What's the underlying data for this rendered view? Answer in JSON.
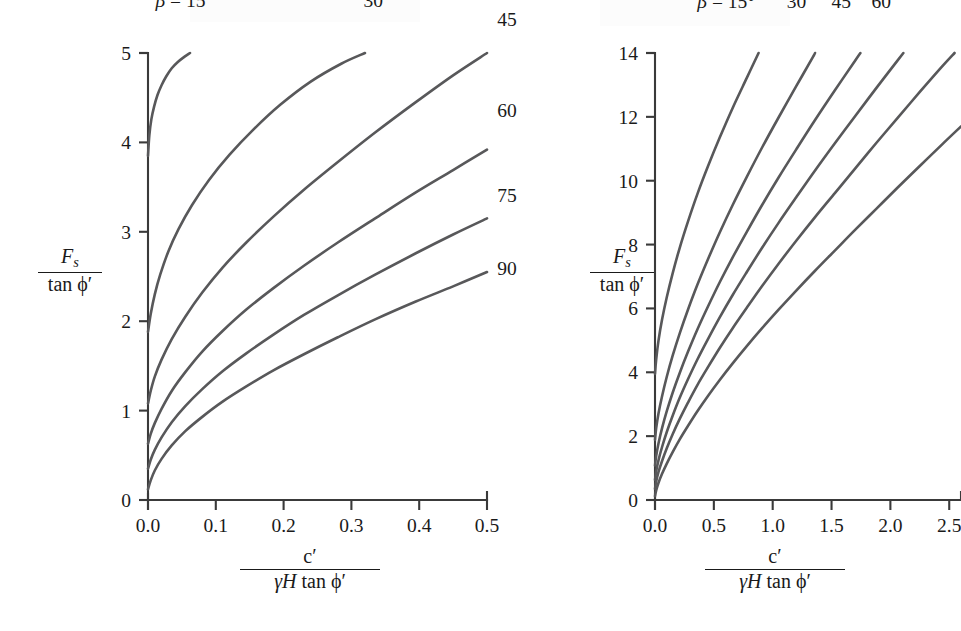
{
  "figure": {
    "background_color": "#ffffff",
    "curve_color": "#58585a",
    "axis_color": "#3a3a3a",
    "text_color": "#1a1a1a"
  },
  "axis_label_parts": {
    "y_numerator": "F",
    "y_numerator_sub": "s",
    "y_denominator": "tan ϕ′",
    "x_numerator": "c′",
    "x_denominator_gamma": "γ",
    "x_denominator_H": "H",
    "x_denominator_rest": "tan ϕ′"
  },
  "chart_data": [
    {
      "id": "left-chart",
      "type": "line",
      "title": "",
      "xlabel": "c′ / (γH tan ϕ′)",
      "ylabel": "F_s / tan ϕ′",
      "xlim": [
        0.0,
        0.5
      ],
      "ylim": [
        0,
        5
      ],
      "xticks": [
        "0.0",
        "0.1",
        "0.2",
        "0.3",
        "0.4",
        "0.5"
      ],
      "xtick_values": [
        0.0,
        0.1,
        0.2,
        0.3,
        0.4,
        0.5
      ],
      "yticks": [
        "0",
        "1",
        "2",
        "3",
        "4",
        "5"
      ],
      "ytick_values": [
        0,
        1,
        2,
        3,
        4,
        5
      ],
      "grid": false,
      "legend": "inline-curve-labels",
      "beta_prefix": "β = 15°",
      "series": [
        {
          "name": "15",
          "label": "β = 15°",
          "label_x": 0.011,
          "label_y": 5.52,
          "points": [
            [
              0.0,
              3.85
            ],
            [
              0.002,
              4.08
            ],
            [
              0.005,
              4.26
            ],
            [
              0.009,
              4.4
            ],
            [
              0.014,
              4.53
            ],
            [
              0.02,
              4.64
            ],
            [
              0.027,
              4.74
            ],
            [
              0.035,
              4.83
            ],
            [
              0.044,
              4.9
            ],
            [
              0.054,
              4.96
            ],
            [
              0.062,
              5.0
            ]
          ]
        },
        {
          "name": "30",
          "label": "30",
          "label_x": 0.318,
          "label_y": 5.52,
          "points": [
            [
              0.0,
              1.88
            ],
            [
              0.004,
              2.08
            ],
            [
              0.01,
              2.3
            ],
            [
              0.018,
              2.52
            ],
            [
              0.03,
              2.78
            ],
            [
              0.045,
              3.03
            ],
            [
              0.065,
              3.3
            ],
            [
              0.09,
              3.58
            ],
            [
              0.12,
              3.86
            ],
            [
              0.155,
              4.14
            ],
            [
              0.195,
              4.42
            ],
            [
              0.24,
              4.68
            ],
            [
              0.285,
              4.88
            ],
            [
              0.32,
              5.0
            ]
          ]
        },
        {
          "name": "45",
          "label": "45",
          "label_x": 0.515,
          "label_y": 5.3,
          "points": [
            [
              0.0,
              1.08
            ],
            [
              0.004,
              1.22
            ],
            [
              0.01,
              1.38
            ],
            [
              0.02,
              1.57
            ],
            [
              0.035,
              1.8
            ],
            [
              0.055,
              2.05
            ],
            [
              0.08,
              2.32
            ],
            [
              0.11,
              2.6
            ],
            [
              0.145,
              2.88
            ],
            [
              0.185,
              3.17
            ],
            [
              0.23,
              3.47
            ],
            [
              0.28,
              3.78
            ],
            [
              0.335,
              4.11
            ],
            [
              0.395,
              4.45
            ],
            [
              0.45,
              4.75
            ],
            [
              0.5,
              5.0
            ]
          ]
        },
        {
          "name": "60",
          "label": "60",
          "label_x": 0.515,
          "label_y": 4.28,
          "points": [
            [
              0.0,
              0.63
            ],
            [
              0.004,
              0.74
            ],
            [
              0.01,
              0.86
            ],
            [
              0.02,
              1.02
            ],
            [
              0.035,
              1.22
            ],
            [
              0.055,
              1.43
            ],
            [
              0.08,
              1.66
            ],
            [
              0.11,
              1.89
            ],
            [
              0.145,
              2.13
            ],
            [
              0.185,
              2.37
            ],
            [
              0.23,
              2.62
            ],
            [
              0.28,
              2.88
            ],
            [
              0.335,
              3.15
            ],
            [
              0.395,
              3.44
            ],
            [
              0.45,
              3.69
            ],
            [
              0.5,
              3.92
            ]
          ]
        },
        {
          "name": "75",
          "label": "75",
          "label_x": 0.515,
          "label_y": 3.33,
          "points": [
            [
              0.0,
              0.35
            ],
            [
              0.004,
              0.45
            ],
            [
              0.01,
              0.56
            ],
            [
              0.02,
              0.7
            ],
            [
              0.035,
              0.87
            ],
            [
              0.055,
              1.05
            ],
            [
              0.08,
              1.24
            ],
            [
              0.11,
              1.44
            ],
            [
              0.145,
              1.64
            ],
            [
              0.185,
              1.85
            ],
            [
              0.23,
              2.07
            ],
            [
              0.28,
              2.29
            ],
            [
              0.335,
              2.52
            ],
            [
              0.395,
              2.76
            ],
            [
              0.45,
              2.97
            ],
            [
              0.5,
              3.15
            ]
          ]
        },
        {
          "name": "90",
          "label": "90",
          "label_x": 0.515,
          "label_y": 2.52,
          "points": [
            [
              0.0,
              0.12
            ],
            [
              0.004,
              0.22
            ],
            [
              0.01,
              0.33
            ],
            [
              0.02,
              0.46
            ],
            [
              0.035,
              0.61
            ],
            [
              0.055,
              0.77
            ],
            [
              0.08,
              0.93
            ],
            [
              0.11,
              1.1
            ],
            [
              0.145,
              1.27
            ],
            [
              0.185,
              1.45
            ],
            [
              0.23,
              1.63
            ],
            [
              0.28,
              1.82
            ],
            [
              0.335,
              2.02
            ],
            [
              0.395,
              2.22
            ],
            [
              0.45,
              2.39
            ],
            [
              0.5,
              2.55
            ]
          ]
        }
      ]
    },
    {
      "id": "right-chart",
      "type": "line",
      "title": "",
      "xlabel": "c′ / (γH tan ϕ′)",
      "ylabel": "F_s / tan ϕ′",
      "xlim": [
        0.0,
        2.6
      ],
      "ylim": [
        0,
        14
      ],
      "xticks": [
        "0.0",
        "0.5",
        "1.0",
        "1.5",
        "2.0",
        "2.5"
      ],
      "xtick_values": [
        0.0,
        0.5,
        1.0,
        1.5,
        2.0,
        2.5
      ],
      "yticks": [
        "0",
        "2",
        "4",
        "6",
        "8",
        "10",
        "12",
        "14"
      ],
      "ytick_values": [
        0,
        2,
        4,
        6,
        8,
        10,
        12,
        14
      ],
      "grid": false,
      "legend": "inline-curve-labels",
      "beta_prefix": "β = 15°",
      "header_labels": [
        "β = 15°",
        "30",
        "45",
        "60"
      ],
      "series": [
        {
          "name": "15",
          "label": "β = 15°",
          "label_x": 0.36,
          "label_y": 15.4,
          "points": [
            [
              0.0,
              3.95
            ],
            [
              0.01,
              4.4
            ],
            [
              0.03,
              5.0
            ],
            [
              0.06,
              5.65
            ],
            [
              0.1,
              6.35
            ],
            [
              0.15,
              7.1
            ],
            [
              0.21,
              7.9
            ],
            [
              0.28,
              8.72
            ],
            [
              0.36,
              9.58
            ],
            [
              0.45,
              10.45
            ],
            [
              0.55,
              11.35
            ],
            [
              0.66,
              12.28
            ],
            [
              0.78,
              13.22
            ],
            [
              0.88,
              14.0
            ]
          ]
        },
        {
          "name": "30",
          "label": "30",
          "label_x": 1.12,
          "label_y": 15.4,
          "points": [
            [
              0.0,
              1.88
            ],
            [
              0.01,
              2.25
            ],
            [
              0.03,
              2.72
            ],
            [
              0.06,
              3.25
            ],
            [
              0.1,
              3.86
            ],
            [
              0.15,
              4.52
            ],
            [
              0.21,
              5.22
            ],
            [
              0.28,
              5.96
            ],
            [
              0.36,
              6.74
            ],
            [
              0.45,
              7.54
            ],
            [
              0.55,
              8.38
            ],
            [
              0.66,
              9.24
            ],
            [
              0.78,
              10.12
            ],
            [
              0.91,
              11.04
            ],
            [
              1.05,
              11.98
            ],
            [
              1.2,
              12.96
            ],
            [
              1.34,
              13.86
            ],
            [
              1.36,
              14.0
            ]
          ]
        },
        {
          "name": "45",
          "label": "45",
          "label_x": 1.5,
          "label_y": 15.4,
          "points": [
            [
              0.0,
              1.08
            ],
            [
              0.01,
              1.38
            ],
            [
              0.03,
              1.78
            ],
            [
              0.06,
              2.25
            ],
            [
              0.1,
              2.78
            ],
            [
              0.15,
              3.36
            ],
            [
              0.21,
              3.98
            ],
            [
              0.28,
              4.64
            ],
            [
              0.36,
              5.34
            ],
            [
              0.45,
              6.06
            ],
            [
              0.55,
              6.82
            ],
            [
              0.66,
              7.6
            ],
            [
              0.78,
              8.4
            ],
            [
              0.91,
              9.24
            ],
            [
              1.05,
              10.1
            ],
            [
              1.2,
              10.98
            ],
            [
              1.36,
              11.9
            ],
            [
              1.53,
              12.84
            ],
            [
              1.7,
              13.76
            ],
            [
              1.745,
              14.0
            ]
          ]
        },
        {
          "name": "60",
          "label": "60",
          "label_x": 1.84,
          "label_y": 15.4,
          "points": [
            [
              0.0,
              0.63
            ],
            [
              0.01,
              0.9
            ],
            [
              0.03,
              1.25
            ],
            [
              0.06,
              1.66
            ],
            [
              0.1,
              2.13
            ],
            [
              0.15,
              2.64
            ],
            [
              0.21,
              3.2
            ],
            [
              0.28,
              3.78
            ],
            [
              0.36,
              4.4
            ],
            [
              0.45,
              5.04
            ],
            [
              0.55,
              5.72
            ],
            [
              0.66,
              6.42
            ],
            [
              0.78,
              7.14
            ],
            [
              0.91,
              7.9
            ],
            [
              1.05,
              8.68
            ],
            [
              1.2,
              9.48
            ],
            [
              1.36,
              10.32
            ],
            [
              1.53,
              11.18
            ],
            [
              1.7,
              12.02
            ],
            [
              1.88,
              12.9
            ],
            [
              2.06,
              13.76
            ],
            [
              2.11,
              14.0
            ]
          ]
        },
        {
          "name": "75",
          "label": "",
          "label_x": null,
          "label_y": null,
          "points": [
            [
              0.0,
              0.35
            ],
            [
              0.01,
              0.58
            ],
            [
              0.03,
              0.88
            ],
            [
              0.06,
              1.22
            ],
            [
              0.1,
              1.62
            ],
            [
              0.15,
              2.06
            ],
            [
              0.21,
              2.54
            ],
            [
              0.28,
              3.05
            ],
            [
              0.36,
              3.6
            ],
            [
              0.45,
              4.16
            ],
            [
              0.55,
              4.76
            ],
            [
              0.66,
              5.38
            ],
            [
              0.78,
              6.02
            ],
            [
              0.91,
              6.7
            ],
            [
              1.05,
              7.4
            ],
            [
              1.2,
              8.12
            ],
            [
              1.36,
              8.86
            ],
            [
              1.53,
              9.62
            ],
            [
              1.7,
              10.38
            ],
            [
              1.88,
              11.18
            ],
            [
              2.06,
              11.96
            ],
            [
              2.25,
              12.78
            ],
            [
              2.44,
              13.58
            ],
            [
              2.545,
              14.0
            ]
          ]
        },
        {
          "name": "90",
          "label": "",
          "label_x": null,
          "label_y": null,
          "points": [
            [
              0.0,
              0.12
            ],
            [
              0.01,
              0.3
            ],
            [
              0.03,
              0.54
            ],
            [
              0.06,
              0.82
            ],
            [
              0.1,
              1.14
            ],
            [
              0.15,
              1.5
            ],
            [
              0.21,
              1.9
            ],
            [
              0.28,
              2.32
            ],
            [
              0.36,
              2.78
            ],
            [
              0.45,
              3.26
            ],
            [
              0.55,
              3.76
            ],
            [
              0.66,
              4.28
            ],
            [
              0.78,
              4.82
            ],
            [
              0.91,
              5.38
            ],
            [
              1.05,
              5.96
            ],
            [
              1.2,
              6.56
            ],
            [
              1.36,
              7.18
            ],
            [
              1.53,
              7.82
            ],
            [
              1.7,
              8.46
            ],
            [
              1.88,
              9.12
            ],
            [
              2.06,
              9.78
            ],
            [
              2.25,
              10.46
            ],
            [
              2.44,
              11.14
            ],
            [
              2.6,
              11.7
            ]
          ]
        }
      ]
    }
  ]
}
